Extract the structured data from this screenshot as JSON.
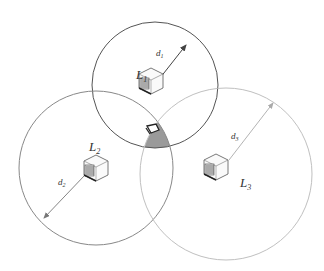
{
  "diagram": {
    "type": "trilateration",
    "nodes": [
      {
        "label": "L",
        "sub": "1",
        "distance_label": "d",
        "distance_sub": "1",
        "circle_color": "#555555"
      },
      {
        "label": "L",
        "sub": "2",
        "distance_label": "d",
        "distance_sub": "2",
        "circle_color": "#888888"
      },
      {
        "label": "L",
        "sub": "3",
        "distance_label": "d",
        "distance_sub": "3",
        "circle_color": "#bbbbbb"
      }
    ],
    "target": {
      "icon": "laptop-icon",
      "region_color": "#9a9a9a"
    }
  }
}
